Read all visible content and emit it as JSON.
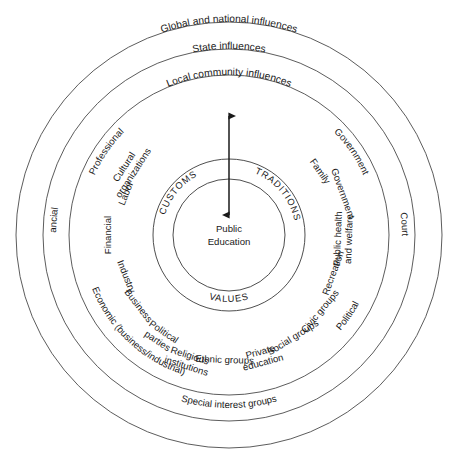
{
  "diagram": {
    "title_core": "Public Education",
    "center": {
      "cx": 229,
      "cy": 235
    },
    "core_terms": [
      {
        "label": "CUSTOMS",
        "position": "upper-left"
      },
      {
        "label": "TRADITIONS",
        "position": "upper-right"
      },
      {
        "label": "VALUES",
        "position": "bottom"
      }
    ],
    "rings": [
      {
        "name": "local",
        "label": "Local community influences",
        "radius": 160
      },
      {
        "name": "state",
        "label": "State influences",
        "radius": 186
      },
      {
        "name": "global",
        "label": "Global and national influences",
        "radius": 213
      }
    ],
    "core_circles": [
      {
        "name": "public-education",
        "radius": 56
      },
      {
        "name": "customs-traditions-values",
        "radius": 76
      }
    ],
    "arrow": {
      "name": "bidirectional-arrow",
      "x": 229,
      "y_top": 113,
      "y_bottom": 218
    },
    "inner_sector_labels": [
      {
        "label": "Labor",
        "angle": -68
      },
      {
        "label": "Cultural",
        "angle": -57,
        "line2": "organizations"
      },
      {
        "label": "Financial",
        "angle": -90
      },
      {
        "label": "Industry",
        "angle": -112
      },
      {
        "label": "Business",
        "angle": -128
      },
      {
        "label": "Political",
        "angle": -146,
        "line2": "parties"
      },
      {
        "label": "Religious",
        "angle": -162,
        "line2": "institutions"
      },
      {
        "label": "Ethnic groups",
        "angle": -178
      },
      {
        "label": "Private",
        "angle": 165,
        "line2": "education"
      },
      {
        "label": "Social groups",
        "angle": 148
      },
      {
        "label": "Civic groups",
        "angle": 130
      },
      {
        "label": "Recreation",
        "angle": 110
      },
      {
        "label": "Public health",
        "angle": 92,
        "line2": "and welfare"
      },
      {
        "label": "Government",
        "angle": 70
      },
      {
        "label": "Family",
        "angle": 55
      }
    ],
    "local_ring_labels": [
      {
        "label": "Professional",
        "position": "upper-left"
      },
      {
        "label": "Government",
        "position": "upper-right"
      },
      {
        "label": "Economic (business/industrial)",
        "position": "lower-left"
      },
      {
        "label": "Political",
        "position": "lower-right"
      }
    ],
    "state_ring_labels": [
      {
        "label": "Financial",
        "position": "left"
      },
      {
        "label": "Courts",
        "position": "right"
      },
      {
        "label": "Special interest groups",
        "position": "bottom"
      }
    ]
  },
  "colors": {
    "stroke": "#4a4a4a",
    "text": "#1a1a1a",
    "background": "#ffffff"
  }
}
